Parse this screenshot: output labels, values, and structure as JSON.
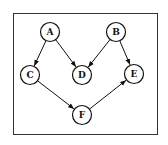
{
  "diagram": {
    "type": "directed-graph",
    "frame": {
      "x": 13,
      "y": 13,
      "width": 144,
      "height": 121,
      "stroke": "#333333"
    },
    "node_radius": 9.5,
    "nodes": [
      {
        "id": "A",
        "label": "A",
        "x": 50,
        "y": 32
      },
      {
        "id": "B",
        "label": "B",
        "x": 116,
        "y": 32
      },
      {
        "id": "C",
        "label": "C",
        "x": 30,
        "y": 75
      },
      {
        "id": "D",
        "label": "D",
        "x": 82,
        "y": 75
      },
      {
        "id": "E",
        "label": "E",
        "x": 134,
        "y": 74
      },
      {
        "id": "F",
        "label": "F",
        "x": 82,
        "y": 115
      }
    ],
    "edges": [
      {
        "from": "A",
        "to": "C"
      },
      {
        "from": "A",
        "to": "D"
      },
      {
        "from": "B",
        "to": "D"
      },
      {
        "from": "B",
        "to": "E"
      },
      {
        "from": "C",
        "to": "F"
      },
      {
        "from": "F",
        "to": "E"
      }
    ]
  }
}
